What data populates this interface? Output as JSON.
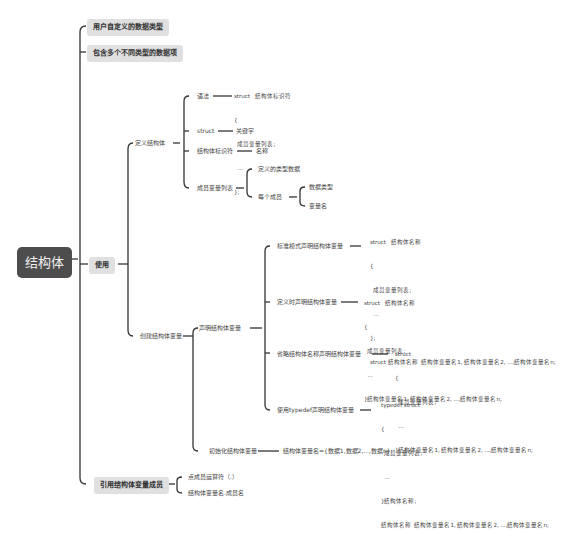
{
  "root": {
    "label": "结构体"
  },
  "branches": {
    "b1": "用户自定义的数据类型",
    "b2": "包含多个不同类型的数据项",
    "b3": "使用",
    "b4": "引用结构体变量成员"
  },
  "use": {
    "define": {
      "label": "定义结构体",
      "syntax": {
        "label": "语法",
        "code": [
          "struct   结构体标识符",
          "{",
          "  成员变量列表;",
          "  ...",
          "};"
        ]
      },
      "struct_kw": {
        "label": "struct",
        "desc": "关键字"
      },
      "identifier": {
        "label": "结构体标识符",
        "desc": "名称"
      },
      "members": {
        "label": "成员变量列表",
        "desc": "定义的类型数据",
        "each": {
          "label": "每个成员",
          "items": [
            "数据类型",
            "变量名"
          ]
        }
      }
    },
    "create": {
      "label": "创建结构体变量",
      "declare": {
        "label": "声明结构体变量",
        "standard": {
          "label": "标准模式声明结构体变量",
          "code": [
            "struct   结构体名称",
            "{",
            "  成员变量列表;",
            "  ...",
            "};",
            "struct 结构体名称  结构体变量名1, 结构体变量名2, ...,结构体变量名n;"
          ]
        },
        "at_define": {
          "label": "定义时声明结构体变量",
          "code": [
            "struct   结构体名称",
            "{",
            "  成员变量列表;",
            "  ...",
            "}结构体变量名1, 结构体变量名2, ...,结构体变量名n;"
          ]
        },
        "anonymous": {
          "label": "省略结构体名称声明结构体变量",
          "code": [
            "struct",
            "{",
            "  成员变量列表;",
            "  ...",
            "}结构体变量名1, 结构体变量名2, ...,结构体变量名n;"
          ]
        },
        "typedef": {
          "label": "使用typedef声明结构体变量",
          "code": [
            "typedef struct",
            "{",
            "  成员变量列表;",
            "  ...",
            "}结构体名称;",
            "结构体名称  结构体变量名1, 结构体变量名2, ...,结构体变量名n;"
          ]
        }
      },
      "init": {
        "label": "初始化结构体变量",
        "desc": "结构体变量名={数据1,数据2,...,数据n};"
      }
    }
  },
  "ref": {
    "items": [
      "点成员运算符（.）",
      "结构体变量名.成员名"
    ]
  },
  "colors": {
    "root_bg": "#4d4d4d",
    "branch_bg": "#e0e0e0",
    "line": "#333333"
  }
}
